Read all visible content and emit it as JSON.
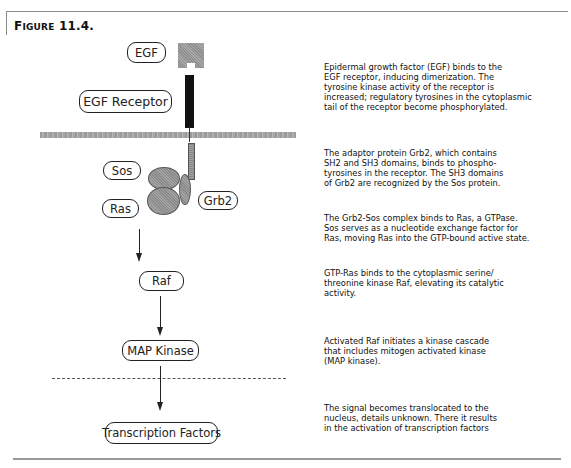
{
  "figure": {
    "title_prefix": "F",
    "title_smallcaps": "IGURE",
    "title_number": "11.4."
  },
  "nodes": {
    "egf": "EGF",
    "egf_receptor": "EGF Receptor",
    "sos": "Sos",
    "ras": "Ras",
    "grb2": "Grb2",
    "raf": "Raf",
    "map_kinase": "MAP Kinase",
    "transcription_factors": "Transcription Factors"
  },
  "descriptions": [
    {
      "step": "egf-binding",
      "lines": [
        "Epidermal growth factor (EGF) binds to the",
        "EGF receptor, inducing dimerization.  The",
        "tyrosine kinase activity of the receptor is",
        "increased; regulatory tyrosines in the cytoplasmic",
        "tail of the receptor become phosphorylated."
      ]
    },
    {
      "step": "grb2-adaptor",
      "lines": [
        "The adaptor protein Grb2, which contains",
        "SH2 and SH3 domains, binds to phospho-",
        "tyrosines in the receptor.  The SH3 domains",
        "of Grb2 are recognized by the Sos protein."
      ]
    },
    {
      "step": "grb2-sos-ras",
      "lines": [
        "The Grb2-Sos complex binds to Ras, a GTPase.",
        "Sos serves as a nucleotide exchange factor for",
        "Ras, moving Ras into the GTP-bound active state."
      ]
    },
    {
      "step": "raf-activation",
      "lines": [
        "GTP-Ras binds to the cytoplasmic serine/",
        "threonine kinase Raf, elevating its catalytic",
        "activity."
      ]
    },
    {
      "step": "map-kinase-cascade",
      "lines": [
        "Activated Raf initiates a kinase cascade",
        "that includes mitogen activated kinase",
        "(MAP kinase)."
      ]
    },
    {
      "step": "nuclear-translocation",
      "lines": [
        "The signal becomes translocated to the",
        "nucleus, details unknown.  There it results",
        "in the activation of transcription factors"
      ]
    }
  ],
  "colors": {
    "receptor": "#111111",
    "membrane": "#a5a5a5",
    "protein_fill": "#999999",
    "outline": "#222222"
  }
}
